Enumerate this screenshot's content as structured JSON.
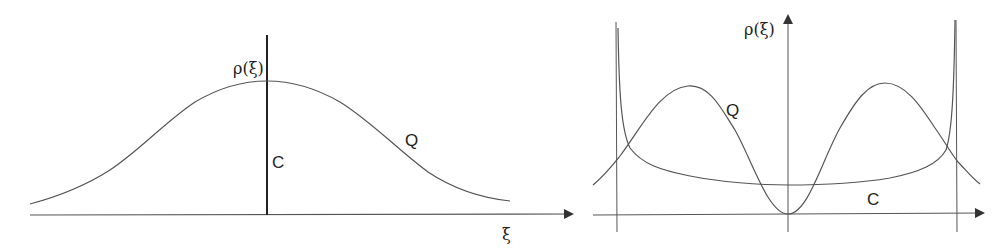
{
  "panels": [
    {
      "id": "left",
      "y_axis_label": "ρ(ξ)",
      "x_axis_label": "ξ",
      "curves": [
        {
          "name": "Q",
          "label": "Q",
          "shape": "gaussian-bell"
        },
        {
          "name": "C",
          "label": "C",
          "shape": "delta-spike"
        }
      ]
    },
    {
      "id": "right",
      "y_axis_label": "ρ(ξ)",
      "curves": [
        {
          "name": "Q",
          "label": "Q",
          "shape": "double-hump"
        },
        {
          "name": "C",
          "label": "C",
          "shape": "arcsine-u"
        }
      ]
    }
  ],
  "colors": {
    "curve": "#555555",
    "axis": "#444444",
    "delta": "#222222"
  }
}
